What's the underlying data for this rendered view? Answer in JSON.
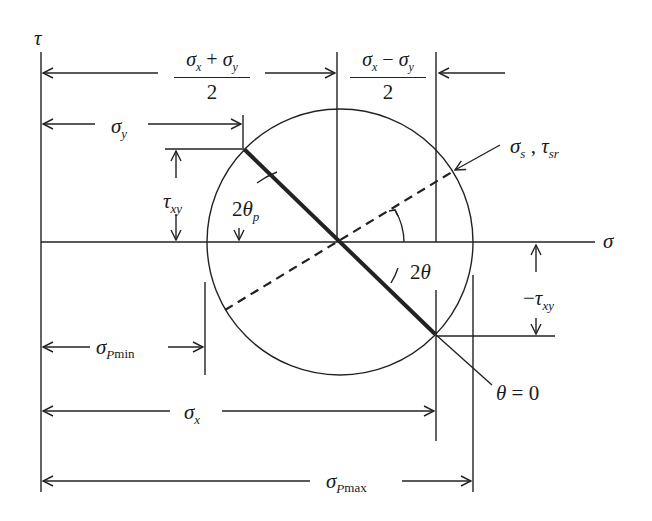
{
  "diagram": {
    "axes": {
      "vertical_label": "τ",
      "horizontal_label": "σ"
    },
    "labels": {
      "mean_stress": {
        "numerator_a": "σ",
        "sub_a": "x",
        "op": " + ",
        "numerator_b": "σ",
        "sub_b": "y",
        "denominator": "2"
      },
      "half_difference": {
        "numerator_a": "σ",
        "sub_a": "x",
        "op": " − ",
        "numerator_b": "σ",
        "sub_b": "y",
        "denominator": "2"
      },
      "sigma_y": {
        "sym": "σ",
        "sub": "y"
      },
      "tau_xy": {
        "sym": "τ",
        "sub": "xy"
      },
      "neg_tau_xy": {
        "prefix": "−",
        "sym": "τ",
        "sub": "xy"
      },
      "two_theta_p": {
        "coef": "2",
        "sym": "θ",
        "sub": "p"
      },
      "two_theta": {
        "coef": "2",
        "sym": "θ"
      },
      "sigma_s_tau_sr": {
        "sym_a": "σ",
        "sub_a": "s",
        "sep": " , ",
        "sym_b": "τ",
        "sub_b": "sr"
      },
      "sigma_p_min": {
        "sym": "σ",
        "sub_p": "P",
        "sub_rest": "min"
      },
      "sigma_x": {
        "sym": "σ",
        "sub": "x"
      },
      "sigma_p_max": {
        "sym": "σ",
        "sub_p": "P",
        "sub_rest": "max"
      },
      "theta_zero": {
        "sym": "θ",
        "eq": " = 0"
      }
    },
    "colors": {
      "line": "#222222",
      "background": "#ffffff"
    }
  }
}
